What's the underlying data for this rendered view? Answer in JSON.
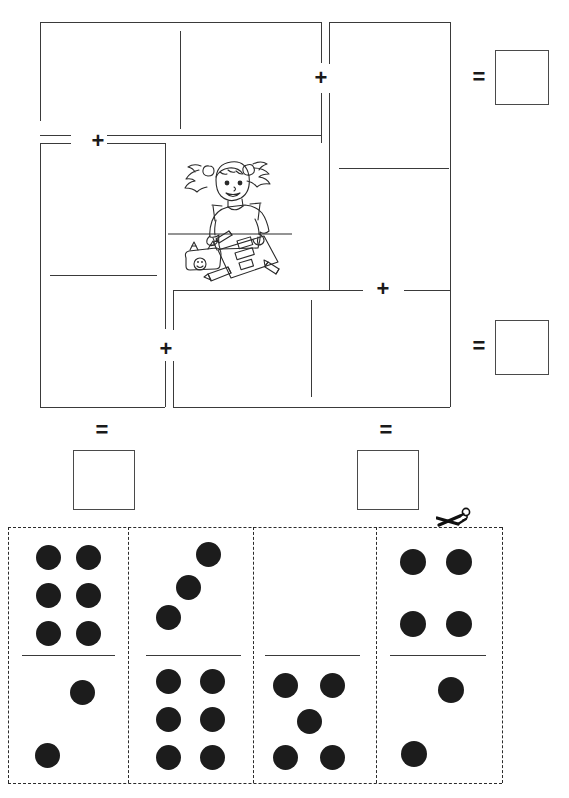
{
  "page": {
    "width": 569,
    "height": 798,
    "background_color": "#ffffff",
    "ink_color": "#3a3a3a",
    "pip_color": "#1c1c1c"
  },
  "operators": {
    "plus": "+",
    "equals": "="
  },
  "equations": [
    {
      "id": "equation-top",
      "operator_1": "+",
      "operator_2": "+",
      "equals": "=",
      "slots": [
        "domino-slot-top-left",
        "domino-slot-top-right"
      ],
      "answer_value": ""
    },
    {
      "id": "equation-bottom",
      "operator_1": "+",
      "operator_2": "+",
      "equals": "=",
      "slots": [
        "domino-slot-bottom-left",
        "domino-slot-bottom-right"
      ],
      "answer_value": ""
    }
  ],
  "domino_slots": [
    {
      "id": "domino-slot-top-left",
      "orientation": "horizontal",
      "x": 40,
      "y": 22,
      "width": 281,
      "height": 121,
      "value": ""
    },
    {
      "id": "domino-slot-top-right",
      "orientation": "vertical",
      "x": 329,
      "y": 22,
      "width": 121,
      "height": 268,
      "value": ""
    },
    {
      "id": "domino-slot-bottom-left",
      "orientation": "vertical",
      "x": 40,
      "y": 143,
      "width": 125,
      "height": 264,
      "value": ""
    },
    {
      "id": "domino-slot-bottom-right",
      "orientation": "horizontal",
      "x": 173,
      "y": 290,
      "width": 277,
      "height": 117,
      "value": ""
    }
  ],
  "answer_boxes": [
    {
      "id": "answer-box-top-right",
      "x": 495,
      "y": 50,
      "size": 52,
      "value": ""
    },
    {
      "id": "answer-box-middle-right",
      "x": 495,
      "y": 320,
      "size": 52,
      "value": ""
    },
    {
      "id": "answer-box-bottom-left",
      "x": 73,
      "y": 450,
      "size": 57,
      "value": ""
    },
    {
      "id": "answer-box-bottom-right",
      "x": 357,
      "y": 450,
      "size": 57,
      "value": ""
    }
  ],
  "illustration": {
    "name": "girl-writing-at-desk",
    "description": "Line-art cartoon of a girl with pigtails sitting at a desk writing on a worksheet, with a pencil case and pencils"
  },
  "cut_strip": {
    "scissors_icon": "scissors-icon",
    "cut_line_style": "dashed",
    "x": 8,
    "y": 527,
    "width": 494,
    "height": 256,
    "dominoes": [
      {
        "id": "domino-1",
        "top_pips": 6,
        "bottom_pips": 2,
        "total": 8,
        "top_pattern": "six-two-by-three",
        "bottom_pattern": "two-diagonal-ne-sw"
      },
      {
        "id": "domino-2",
        "top_pips": 3,
        "bottom_pips": 6,
        "total": 9,
        "top_pattern": "three-diagonal-ne-sw",
        "bottom_pattern": "six-two-by-three"
      },
      {
        "id": "domino-3",
        "top_pips": 0,
        "bottom_pips": 5,
        "total": 5,
        "top_pattern": "blank",
        "bottom_pattern": "five-quincunx"
      },
      {
        "id": "domino-4",
        "top_pips": 4,
        "bottom_pips": 2,
        "total": 6,
        "top_pattern": "four-square",
        "bottom_pattern": "two-diagonal-ne-sw"
      }
    ]
  }
}
